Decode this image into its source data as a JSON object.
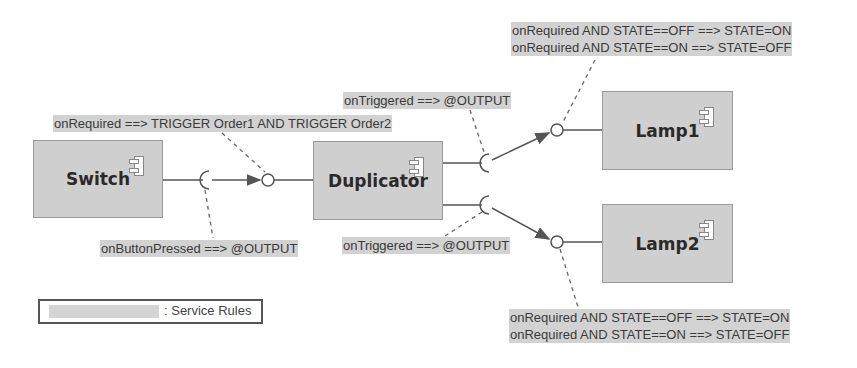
{
  "components": [
    {
      "id": "switch",
      "label": "Switch"
    },
    {
      "id": "duplicator",
      "label": "Duplicator"
    },
    {
      "id": "lamp1",
      "label": "Lamp1"
    },
    {
      "id": "lamp2",
      "label": "Lamp2"
    }
  ],
  "rules": {
    "switch_output": "onButtonPressed ==> @OUTPUT",
    "duplicator_required": "onRequired ==> TRIGGER Order1 AND TRIGGER Order2",
    "duplicator_output_top": "onTriggered ==> @OUTPUT",
    "duplicator_output_bottom": "onTriggered ==> @OUTPUT",
    "lamp1_rule_1": "onRequired AND STATE==OFF ==> STATE=ON",
    "lamp1_rule_2": "onRequired AND STATE==ON ==> STATE=OFF",
    "lamp2_rule_1": "onRequired AND STATE==OFF ==> STATE=ON",
    "lamp2_rule_2": "onRequired AND STATE==ON ==> STATE=OFF"
  },
  "legend": {
    "label": ": Service Rules"
  },
  "colors": {
    "component_fill": "#cfcfcf",
    "rule_highlight": "#d2d2d2",
    "line": "#555555"
  }
}
